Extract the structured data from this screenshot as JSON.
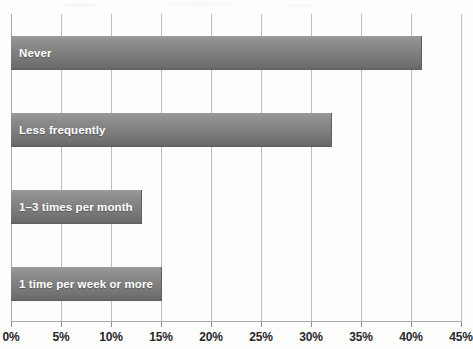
{
  "chart_data": {
    "type": "bar",
    "orientation": "horizontal",
    "title": "",
    "subtitle": "",
    "xlabel": "",
    "ylabel": "",
    "categories": [
      "Never",
      "Less frequently",
      "1–3 times per month",
      "1 time per week or more"
    ],
    "values": [
      41,
      32,
      13,
      15
    ],
    "value_suffix": "%",
    "xlim": [
      0,
      45
    ],
    "xtick_values": [
      0,
      5,
      10,
      15,
      20,
      25,
      30,
      35,
      40,
      45
    ],
    "xtick_labels": [
      "0%",
      "5%",
      "10%",
      "15%",
      "20%",
      "25%",
      "30%",
      "35%",
      "40%",
      "45%"
    ],
    "grid": "vertical",
    "legend": "none",
    "bar_label_position": "inside-left",
    "colors": {
      "bar_top": "#9a9a9a",
      "bar_bottom": "#676767",
      "bar_edge": "#5f5f5f",
      "bar_label_text": "#ffffff",
      "gridline": "#bdbdbd",
      "axis_line": "#a9a9a9",
      "tick_label_text": "#27272a",
      "background": "#fdfdfc"
    }
  }
}
